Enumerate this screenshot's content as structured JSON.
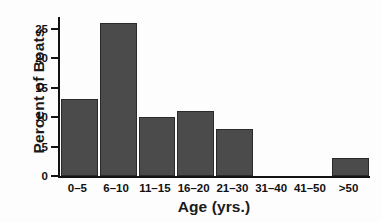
{
  "chart_data": {
    "type": "bar",
    "title": "",
    "subtitle": "",
    "xlabel": "Age (yrs.)",
    "ylabel": "Percent of Boats",
    "categories": [
      "0–5",
      "6–10",
      "11–15",
      "16–20",
      "21–30",
      "31–40",
      "41–50",
      ">50"
    ],
    "values": [
      13,
      26,
      10,
      11,
      8,
      0,
      0,
      3
    ],
    "ylim": [
      0,
      27
    ],
    "yticks": [
      0,
      5,
      10,
      15,
      20,
      25
    ],
    "ytick_labels": [
      "0",
      "5",
      "10",
      "15",
      "20",
      "25"
    ],
    "grid": false,
    "legend": null,
    "bar_color": "#4b4b4b",
    "bar_edge_color": "#2a2a2a",
    "axis_color": "#121212",
    "background_color": "#fdfdfd",
    "annotations": []
  }
}
